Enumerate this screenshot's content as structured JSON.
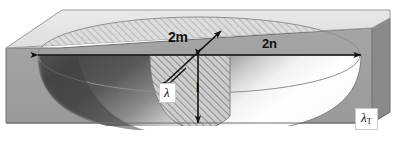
{
  "figure": {
    "type": "technical-diagram",
    "width": 396,
    "height": 141,
    "background": "#ffffff"
  },
  "labels": {
    "minor_axis": "2m",
    "major_axis": "2n",
    "depth": "l",
    "cavity_conductivity": "λ",
    "medium_conductivity_base": "λ",
    "medium_conductivity_sub": "T"
  },
  "dimensions": {
    "minor_axis_arrow": {
      "x1": 167,
      "y1": 81,
      "x2": 221,
      "y2": 31,
      "double_headed": true
    },
    "major_axis_arrow": {
      "x1": 38,
      "y1": 55,
      "x2": 361,
      "y2": 55,
      "double_headed": true
    },
    "depth_arrow": {
      "x1": 198,
      "y1": 56,
      "x2": 198,
      "y2": 123,
      "double_headed": true
    }
  },
  "geometry": {
    "slab_top_face": "parallelogram",
    "slab_front_face": "rectangle",
    "cavity_shape": "half-ellipsoid",
    "ellipse_center_x": 199,
    "ellipse_center_y": 55,
    "ellipse_rx": 161,
    "ellipse_ry": 38,
    "hatched_section": "vertical cross-section plane through cavity"
  },
  "colors": {
    "top_face": "#e2e2e2",
    "front_face": "#9e9e9e",
    "right_face": "#8c8c8c",
    "cavity_shadow_dark": "#4f4f4f",
    "cavity_mid": "#7c7c7c",
    "cavity_highlight": "#ffffff",
    "hatch_fill": "#cfcfcf",
    "hatch_line": "#8d8d8d",
    "outline": "#6f6f6f",
    "arrow": "#121212",
    "label_box_bg": "#ffffff",
    "label_box_border": "#c9c9c9"
  }
}
